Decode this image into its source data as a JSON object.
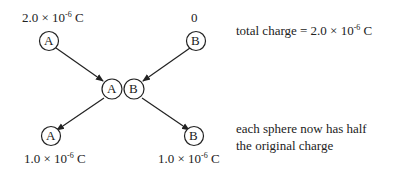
{
  "diagram": {
    "initial": {
      "sphere_a": {
        "label": "A",
        "charge_mantissa": "2.0 × 10",
        "charge_exp": "-6",
        "charge_unit": " C"
      },
      "sphere_b": {
        "label": "B",
        "charge": "0"
      }
    },
    "contact": {
      "sphere_a": {
        "label": "A"
      },
      "sphere_b": {
        "label": "B"
      }
    },
    "final": {
      "sphere_a": {
        "label": "A",
        "charge_mantissa": "1.0 × 10",
        "charge_exp": "-6",
        "charge_unit": " C"
      },
      "sphere_b": {
        "label": "B",
        "charge_mantissa": "1.0 × 10",
        "charge_exp": "-6",
        "charge_unit": " C"
      }
    },
    "notes": {
      "total_prefix": "total charge = 2.0 × 10",
      "total_exp": "-6",
      "total_unit": " C",
      "half_line1": "each sphere now has half",
      "half_line2": "the original charge"
    },
    "colors": {
      "stroke": "#222222",
      "background": "#ffffff"
    }
  }
}
